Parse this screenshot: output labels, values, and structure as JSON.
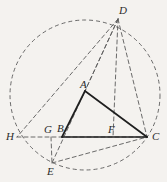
{
  "figure": {
    "background_color": "#f4f2ef",
    "stroke_color": "#3a3a3a",
    "solid_color": "#1f1f1f",
    "dash_color": "#5a5a5a",
    "canvas": {
      "width": 167,
      "height": 182
    }
  },
  "points": [
    {
      "id": "A",
      "label": "A",
      "x": 85,
      "y": 91,
      "label_x": 80,
      "label_y": 79
    },
    {
      "id": "B",
      "label": "B",
      "x": 62,
      "y": 137,
      "label_x": 57,
      "label_y": 123
    },
    {
      "id": "C",
      "label": "C",
      "x": 147,
      "y": 137,
      "label_x": 152,
      "label_y": 131
    },
    {
      "id": "D",
      "label": "D",
      "x": 118,
      "y": 19,
      "label_x": 119,
      "label_y": 5
    },
    {
      "id": "E",
      "label": "E",
      "x": 52,
      "y": 163,
      "label_x": 47,
      "label_y": 166
    },
    {
      "id": "F",
      "label": "F",
      "x": 113,
      "y": 137,
      "label_x": 108,
      "label_y": 124
    },
    {
      "id": "G",
      "label": "G",
      "x": 51,
      "y": 137,
      "label_x": 44,
      "label_y": 124
    },
    {
      "id": "H",
      "label": "H",
      "x": 17,
      "y": 137,
      "label_x": 6,
      "label_y": 131
    }
  ],
  "circle": {
    "name": "circumcircle",
    "center_x": 85,
    "center_y": 95,
    "radius": 75,
    "style": "dashed"
  },
  "segments": [
    {
      "name": "segment-AB",
      "from": "A",
      "to": "B",
      "style": "solid"
    },
    {
      "name": "segment-AC",
      "from": "A",
      "to": "C",
      "style": "solid"
    },
    {
      "name": "segment-BC",
      "from": "B",
      "to": "C",
      "style": "solid"
    },
    {
      "name": "segment-DH",
      "from": "D",
      "to": "H",
      "style": "dashed"
    },
    {
      "name": "segment-DE",
      "from": "D",
      "to": "E",
      "style": "dashed"
    },
    {
      "name": "segment-DA",
      "from": "D",
      "to": "A",
      "style": "dashed"
    },
    {
      "name": "segment-DC",
      "from": "D",
      "to": "C",
      "style": "dashed"
    },
    {
      "name": "segment-DF",
      "from": "D",
      "to": "F",
      "style": "dashed"
    },
    {
      "name": "segment-HC",
      "from": "H",
      "to": "C",
      "style": "dashed"
    },
    {
      "name": "segment-GE",
      "from": "G",
      "to": "E",
      "style": "dashed"
    },
    {
      "name": "segment-EC",
      "from": "E",
      "to": "C",
      "style": "dashed"
    }
  ]
}
